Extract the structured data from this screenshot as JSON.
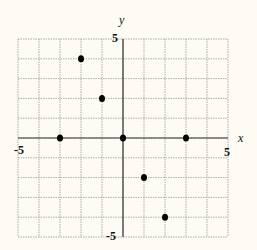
{
  "chart_data": {
    "type": "scatter",
    "title": "",
    "xlabel": "x",
    "ylabel": "y",
    "xlim": [
      -5,
      5
    ],
    "ylim": [
      -5,
      5
    ],
    "grid": true,
    "tick_labels": {
      "x_min": "-5",
      "x_max": "5",
      "y_min": "-5",
      "y_max": "5"
    },
    "points": [
      {
        "x": -3,
        "y": 0
      },
      {
        "x": -2,
        "y": 4
      },
      {
        "x": -1,
        "y": 2
      },
      {
        "x": 0,
        "y": 0
      },
      {
        "x": 1,
        "y": -2
      },
      {
        "x": 2,
        "y": -4
      },
      {
        "x": 3,
        "y": 0
      }
    ]
  },
  "colors": {
    "background": "#fdfbf3",
    "grid": "#9a9a9a",
    "axis": "#333333",
    "point": "#000000"
  }
}
